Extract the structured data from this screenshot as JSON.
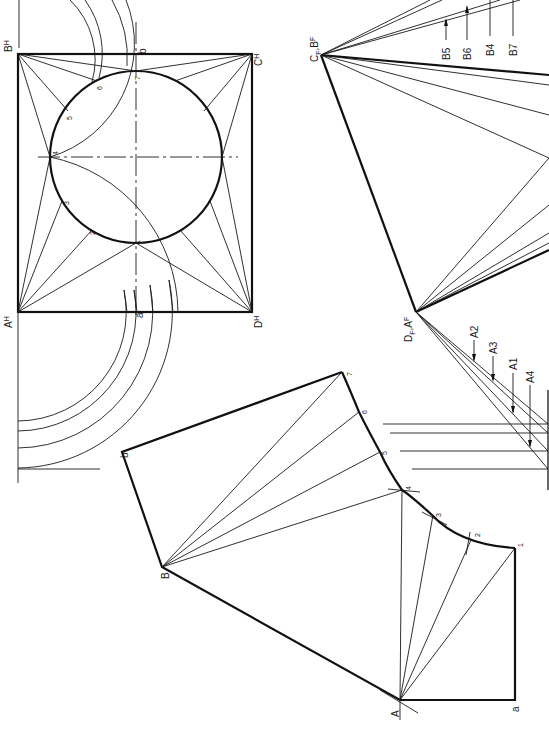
{
  "figure": {
    "colors": {
      "ink": "#111111",
      "paper": "#ffffff"
    }
  },
  "plan_view": {
    "corner_labels": {
      "A": "A",
      "A_sub": "H",
      "B": "B",
      "B_sub": "H",
      "C": "C",
      "C_sub": "H",
      "D": "D",
      "D_sub": "H"
    },
    "seam_labels": {
      "a": "a",
      "b": "b"
    },
    "circle_points": [
      "1",
      "2",
      "3",
      "4",
      "5",
      "6",
      "7"
    ]
  },
  "true_length_diagrams": {
    "upper_apex": {
      "label1": "C",
      "sub1": "F",
      "sep": ",",
      "label2": "B",
      "sub2": "F"
    },
    "lower_apex": {
      "label1": "D",
      "sub1": "F",
      "sep": ",",
      "label2": "A",
      "sub2": "F"
    },
    "b_callouts": [
      "B5",
      "B6",
      "B4",
      "B7"
    ],
    "a_callouts": [
      "A2",
      "A3",
      "A1",
      "A4"
    ]
  },
  "pattern": {
    "vertex_labels": {
      "A": "A",
      "B": "B",
      "a": "a",
      "b": "b"
    },
    "curve_points": [
      "1",
      "2",
      "3",
      "4",
      "5",
      "6",
      "7"
    ]
  }
}
